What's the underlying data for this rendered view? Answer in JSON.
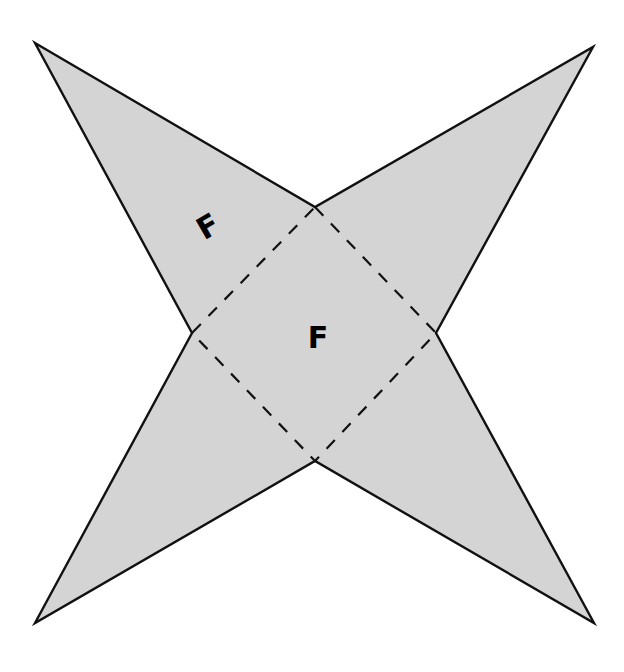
{
  "diagram": {
    "type": "net",
    "colors": {
      "fill": "#d4d4d4",
      "stroke": "#111111",
      "background": "#ffffff"
    },
    "outer_vertices": {
      "top_left": [
        35,
        43
      ],
      "top_right": [
        593,
        47
      ],
      "bottom_right": [
        594,
        623
      ],
      "bottom_left": [
        35,
        623
      ]
    },
    "inner_vertices": {
      "top": [
        315,
        207
      ],
      "right": [
        436,
        333
      ],
      "bottom": [
        315,
        461
      ],
      "left": [
        192,
        333
      ]
    },
    "labels": [
      {
        "id": "face-label-triangle",
        "text": "F",
        "x": 209,
        "y": 228,
        "rotation": -30
      },
      {
        "id": "face-label-base",
        "text": "F",
        "x": 318,
        "y": 339,
        "rotation": 0
      }
    ]
  }
}
